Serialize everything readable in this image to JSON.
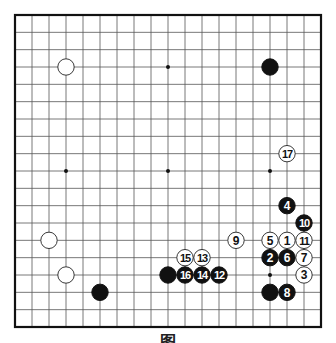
{
  "diagram": {
    "type": "go-board",
    "size": 19,
    "caption": "图",
    "colors": {
      "board": "#ffffff",
      "line": "#555555",
      "border": "#111111",
      "black": "#111111",
      "white": "#ffffff"
    },
    "star_points": [
      [
        3,
        3
      ],
      [
        9,
        3
      ],
      [
        15,
        3
      ],
      [
        3,
        9
      ],
      [
        9,
        9
      ],
      [
        15,
        9
      ],
      [
        3,
        15
      ],
      [
        9,
        15
      ],
      [
        15,
        15
      ]
    ],
    "stones": [
      {
        "col": 3,
        "row": 3,
        "color": "white",
        "label": ""
      },
      {
        "col": 15,
        "row": 3,
        "color": "black",
        "label": ""
      },
      {
        "col": 2,
        "row": 13,
        "color": "white",
        "label": ""
      },
      {
        "col": 3,
        "row": 15,
        "color": "white",
        "label": ""
      },
      {
        "col": 5,
        "row": 16,
        "color": "black",
        "label": ""
      },
      {
        "col": 9,
        "row": 15,
        "color": "black",
        "label": ""
      },
      {
        "col": 15,
        "row": 16,
        "color": "black",
        "label": ""
      },
      {
        "col": 16,
        "row": 13,
        "color": "white",
        "label": "1"
      },
      {
        "col": 15,
        "row": 14,
        "color": "black",
        "label": "2"
      },
      {
        "col": 17,
        "row": 15,
        "color": "white",
        "label": "3"
      },
      {
        "col": 16,
        "row": 11,
        "color": "black",
        "label": "4"
      },
      {
        "col": 15,
        "row": 13,
        "color": "white",
        "label": "5"
      },
      {
        "col": 16,
        "row": 14,
        "color": "black",
        "label": "6"
      },
      {
        "col": 17,
        "row": 14,
        "color": "white",
        "label": "7"
      },
      {
        "col": 16,
        "row": 16,
        "color": "black",
        "label": "8"
      },
      {
        "col": 13,
        "row": 13,
        "color": "white",
        "label": "9"
      },
      {
        "col": 17,
        "row": 12,
        "color": "black",
        "label": "10"
      },
      {
        "col": 17,
        "row": 13,
        "color": "white",
        "label": "11"
      },
      {
        "col": 12,
        "row": 15,
        "color": "black",
        "label": "12"
      },
      {
        "col": 11,
        "row": 14,
        "color": "white",
        "label": "13"
      },
      {
        "col": 11,
        "row": 15,
        "color": "black",
        "label": "14"
      },
      {
        "col": 10,
        "row": 14,
        "color": "white",
        "label": "15"
      },
      {
        "col": 10,
        "row": 15,
        "color": "black",
        "label": "16"
      },
      {
        "col": 16,
        "row": 8,
        "color": "white",
        "label": "17"
      }
    ]
  }
}
